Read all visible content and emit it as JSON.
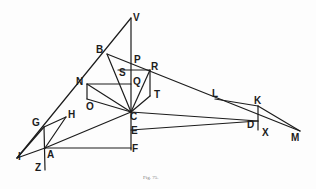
{
  "figure": {
    "caption": "Fig. 75.",
    "line_color": "#1c1c1c",
    "points": {
      "V": "V",
      "B": "B",
      "P": "P",
      "S": "S",
      "R": "R",
      "Q": "Q",
      "N": "N",
      "O": "O",
      "T": "T",
      "C": "C",
      "E": "E",
      "F": "F",
      "L": "L",
      "K": "K",
      "D": "D",
      "X": "X",
      "M": "M",
      "G": "G",
      "H": "H",
      "I": "I",
      "A": "A",
      "Z": "Z"
    }
  }
}
